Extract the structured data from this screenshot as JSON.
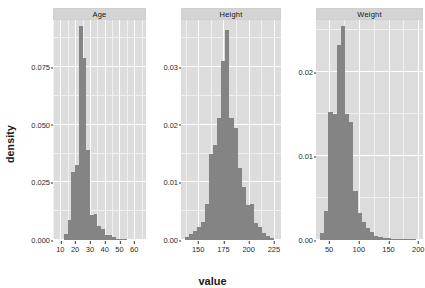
{
  "chart_data": {
    "type": "bar",
    "chart_kind": "faceted-histogram-density",
    "title": "",
    "xlabel": "value",
    "ylabel": "density",
    "grid": true,
    "legend": "none",
    "facet_variable": "variable",
    "bar_color": "#848484",
    "panel_background": "#dcdcdc",
    "gridline_color": "#ffffff",
    "strip_background": "#d4d4d4",
    "panels": [
      {
        "label": "Age",
        "xlim": [
          5,
          68
        ],
        "ylim": [
          0,
          0.0955
        ],
        "xticks": [
          10,
          20,
          30,
          40,
          50,
          60
        ],
        "xtick_labels": [
          "10",
          "20",
          "30",
          "40",
          "50",
          "60"
        ],
        "yticks": [
          0.0,
          0.025,
          0.05,
          0.075
        ],
        "ytick_labels": [
          "0.000",
          "0.025",
          "0.050",
          "0.075"
        ],
        "binwidth": 2.5,
        "bins": [
          {
            "x0": 12.5,
            "x1": 15.0,
            "density": 0.0025
          },
          {
            "x0": 15.0,
            "x1": 17.5,
            "density": 0.0085
          },
          {
            "x0": 17.5,
            "x1": 20.0,
            "density": 0.0295
          },
          {
            "x0": 20.0,
            "x1": 22.5,
            "density": 0.0325
          },
          {
            "x0": 22.5,
            "x1": 25.0,
            "density": 0.093
          },
          {
            "x0": 25.0,
            "x1": 27.5,
            "density": 0.079
          },
          {
            "x0": 27.5,
            "x1": 30.0,
            "density": 0.039
          },
          {
            "x0": 30.0,
            "x1": 32.5,
            "density": 0.011
          },
          {
            "x0": 32.5,
            "x1": 35.0,
            "density": 0.0115
          },
          {
            "x0": 35.0,
            "x1": 37.5,
            "density": 0.0062
          },
          {
            "x0": 37.5,
            "x1": 40.0,
            "density": 0.0048
          },
          {
            "x0": 40.0,
            "x1": 42.5,
            "density": 0.0022
          },
          {
            "x0": 42.5,
            "x1": 45.0,
            "density": 0.002
          },
          {
            "x0": 45.0,
            "x1": 47.5,
            "density": 0.0012
          },
          {
            "x0": 47.5,
            "x1": 50.0,
            "density": 0.0006
          },
          {
            "x0": 50.0,
            "x1": 52.5,
            "density": 0.0004
          },
          {
            "x0": 52.5,
            "x1": 55.0,
            "density": 0.0003
          },
          {
            "x0": 55.0,
            "x1": 57.5,
            "density": 0.0002
          },
          {
            "x0": 57.5,
            "x1": 60.0,
            "density": 0.0002
          },
          {
            "x0": 60.0,
            "x1": 62.5,
            "density": 0.0001
          }
        ]
      },
      {
        "label": "Height",
        "xlim": [
          133,
          232
        ],
        "ylim": [
          0,
          0.0382
        ],
        "xticks": [
          150,
          175,
          200,
          225
        ],
        "xtick_labels": [
          "150",
          "175",
          "200",
          "225"
        ],
        "yticks": [
          0.0,
          0.01,
          0.02,
          0.03
        ],
        "ytick_labels": [
          "0.00",
          "0.01",
          "0.02",
          "0.03"
        ],
        "binwidth": 4,
        "bins": [
          {
            "x0": 137,
            "x1": 141,
            "density": 0.0005
          },
          {
            "x0": 141,
            "x1": 145,
            "density": 0.001
          },
          {
            "x0": 145,
            "x1": 149,
            "density": 0.0015
          },
          {
            "x0": 149,
            "x1": 153,
            "density": 0.0022
          },
          {
            "x0": 153,
            "x1": 157,
            "density": 0.0032
          },
          {
            "x0": 157,
            "x1": 161,
            "density": 0.0062
          },
          {
            "x0": 161,
            "x1": 165,
            "density": 0.015
          },
          {
            "x0": 165,
            "x1": 169,
            "density": 0.0165
          },
          {
            "x0": 169,
            "x1": 173,
            "density": 0.0212
          },
          {
            "x0": 173,
            "x1": 177,
            "density": 0.031
          },
          {
            "x0": 177,
            "x1": 181,
            "density": 0.0365
          },
          {
            "x0": 181,
            "x1": 185,
            "density": 0.0212
          },
          {
            "x0": 185,
            "x1": 189,
            "density": 0.0195
          },
          {
            "x0": 189,
            "x1": 193,
            "density": 0.0125
          },
          {
            "x0": 193,
            "x1": 197,
            "density": 0.0092
          },
          {
            "x0": 197,
            "x1": 201,
            "density": 0.006
          },
          {
            "x0": 201,
            "x1": 205,
            "density": 0.0062
          },
          {
            "x0": 205,
            "x1": 209,
            "density": 0.003
          },
          {
            "x0": 209,
            "x1": 213,
            "density": 0.0022
          },
          {
            "x0": 213,
            "x1": 217,
            "density": 0.0012
          },
          {
            "x0": 217,
            "x1": 221,
            "density": 0.0007
          },
          {
            "x0": 221,
            "x1": 225,
            "density": 0.0004
          }
        ]
      },
      {
        "label": "Weight",
        "xlim": [
          28,
          208
        ],
        "ylim": [
          0,
          0.0262
        ],
        "xticks": [
          50,
          100,
          150,
          200
        ],
        "xtick_labels": [
          "50",
          "100",
          "150",
          "200"
        ],
        "yticks": [
          0.0,
          0.01,
          0.02
        ],
        "ytick_labels": [
          "0.00",
          "0.01",
          "0.02"
        ],
        "binwidth": 7,
        "bins": [
          {
            "x0": 35,
            "x1": 42,
            "density": 0.0008
          },
          {
            "x0": 42,
            "x1": 49,
            "density": 0.0035
          },
          {
            "x0": 49,
            "x1": 56,
            "density": 0.0152
          },
          {
            "x0": 56,
            "x1": 63,
            "density": 0.015
          },
          {
            "x0": 63,
            "x1": 70,
            "density": 0.0232
          },
          {
            "x0": 70,
            "x1": 77,
            "density": 0.0255
          },
          {
            "x0": 77,
            "x1": 84,
            "density": 0.015
          },
          {
            "x0": 84,
            "x1": 91,
            "density": 0.014
          },
          {
            "x0": 91,
            "x1": 98,
            "density": 0.0058
          },
          {
            "x0": 98,
            "x1": 105,
            "density": 0.0032
          },
          {
            "x0": 105,
            "x1": 112,
            "density": 0.0022
          },
          {
            "x0": 112,
            "x1": 119,
            "density": 0.0014
          },
          {
            "x0": 119,
            "x1": 126,
            "density": 0.0009
          },
          {
            "x0": 126,
            "x1": 133,
            "density": 0.0005
          },
          {
            "x0": 133,
            "x1": 140,
            "density": 0.0003
          },
          {
            "x0": 140,
            "x1": 147,
            "density": 0.0002
          },
          {
            "x0": 147,
            "x1": 154,
            "density": 0.0002
          },
          {
            "x0": 154,
            "x1": 161,
            "density": 0.0001
          },
          {
            "x0": 161,
            "x1": 168,
            "density": 0.0001
          },
          {
            "x0": 168,
            "x1": 175,
            "density": 0.0001
          },
          {
            "x0": 175,
            "x1": 182,
            "density": 0.0001
          },
          {
            "x0": 182,
            "x1": 189,
            "density": 0.0001
          },
          {
            "x0": 189,
            "x1": 196,
            "density": 0.0001
          }
        ]
      }
    ]
  }
}
